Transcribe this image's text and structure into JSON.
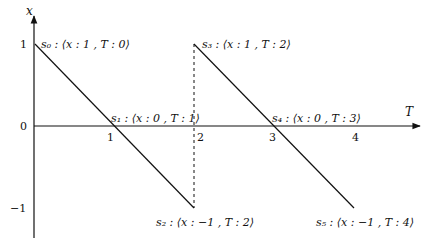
{
  "diagram": {
    "axes": {
      "x_axis_label": "T",
      "y_axis_label": "x",
      "x_ticks": [
        "1",
        "2",
        "3",
        "4"
      ],
      "y_ticks": [
        "1",
        "0",
        "−1"
      ]
    },
    "states": [
      {
        "id": "s0",
        "label": "s₀ : ⟨x : 1 , T : 0⟩",
        "x": 1,
        "T": 0
      },
      {
        "id": "s1",
        "label": "s₁ : ⟨x : 0 , T : 1⟩",
        "x": 0,
        "T": 1
      },
      {
        "id": "s2",
        "label": "s₂ : ⟨x : −1 , T : 2⟩",
        "x": -1,
        "T": 2
      },
      {
        "id": "s3",
        "label": "s₃ : ⟨x : 1 , T : 2⟩",
        "x": 1,
        "T": 2
      },
      {
        "id": "s4",
        "label": "s₄ : ⟨x : 0 , T : 3⟩",
        "x": 0,
        "T": 3
      },
      {
        "id": "s5",
        "label": "s₅ : ⟨x : −1 , T : 4⟩",
        "x": -1,
        "T": 4
      }
    ],
    "segments": [
      {
        "from": "s0",
        "to": "s2",
        "style": "solid"
      },
      {
        "from": "s2",
        "to": "s3",
        "style": "dashed"
      },
      {
        "from": "s3",
        "to": "s5",
        "style": "solid"
      }
    ],
    "line_color": "#111111"
  }
}
